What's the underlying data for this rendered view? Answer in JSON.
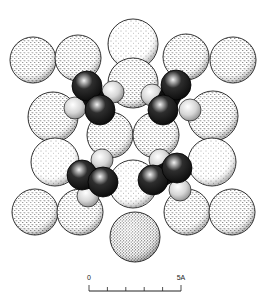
{
  "figure": {
    "width": 266,
    "height": 298,
    "colors": {
      "background": "#ffffff",
      "outline": "#1a1a1a",
      "stipple": "#2a2a2a",
      "dark_atom": "#1c1c1c",
      "dark_atom_highlight": "#e8e8e8",
      "light_atom": "#d8d8d8"
    }
  },
  "large_spheres": [
    {
      "cx": 133,
      "cy": 44,
      "r": 25,
      "density": "light"
    },
    {
      "cx": 33,
      "cy": 60,
      "r": 23,
      "density": "medium"
    },
    {
      "cx": 78,
      "cy": 58,
      "r": 23,
      "density": "medium"
    },
    {
      "cx": 186,
      "cy": 57,
      "r": 23,
      "density": "medium"
    },
    {
      "cx": 233,
      "cy": 60,
      "r": 23,
      "density": "medium"
    },
    {
      "cx": 133,
      "cy": 83,
      "r": 25,
      "density": "medium"
    },
    {
      "cx": 53,
      "cy": 117,
      "r": 25,
      "density": "medium"
    },
    {
      "cx": 213,
      "cy": 116,
      "r": 25,
      "density": "medium"
    },
    {
      "cx": 110,
      "cy": 135,
      "r": 23,
      "density": "medium"
    },
    {
      "cx": 156,
      "cy": 135,
      "r": 23,
      "density": "medium"
    },
    {
      "cx": 55,
      "cy": 162,
      "r": 24,
      "density": "light"
    },
    {
      "cx": 212,
      "cy": 162,
      "r": 24,
      "density": "light"
    },
    {
      "cx": 133,
      "cy": 184,
      "r": 24,
      "density": "light"
    },
    {
      "cx": 35,
      "cy": 212,
      "r": 23,
      "density": "medium"
    },
    {
      "cx": 80,
      "cy": 212,
      "r": 23,
      "density": "medium"
    },
    {
      "cx": 187,
      "cy": 212,
      "r": 23,
      "density": "medium"
    },
    {
      "cx": 232,
      "cy": 212,
      "r": 23,
      "density": "medium"
    },
    {
      "cx": 135,
      "cy": 237,
      "r": 25,
      "density": "dense"
    }
  ],
  "molecules": [
    {
      "name": "upper-left",
      "light_atoms": [
        {
          "cx": 75,
          "cy": 108,
          "r": 11
        },
        {
          "cx": 113,
          "cy": 92,
          "r": 11
        }
      ],
      "dark_atoms": [
        {
          "cx": 87,
          "cy": 86,
          "r": 15
        },
        {
          "cx": 100,
          "cy": 110,
          "r": 15
        }
      ]
    },
    {
      "name": "upper-right",
      "light_atoms": [
        {
          "cx": 152,
          "cy": 95,
          "r": 11
        },
        {
          "cx": 190,
          "cy": 110,
          "r": 11
        }
      ],
      "dark_atoms": [
        {
          "cx": 176,
          "cy": 85,
          "r": 15
        },
        {
          "cx": 163,
          "cy": 110,
          "r": 15
        }
      ]
    },
    {
      "name": "lower-left",
      "light_atoms": [
        {
          "cx": 102,
          "cy": 160,
          "r": 11
        },
        {
          "cx": 88,
          "cy": 196,
          "r": 11
        }
      ],
      "dark_atoms": [
        {
          "cx": 82,
          "cy": 175,
          "r": 15
        },
        {
          "cx": 103,
          "cy": 182,
          "r": 15
        }
      ]
    },
    {
      "name": "lower-right",
      "light_atoms": [
        {
          "cx": 160,
          "cy": 160,
          "r": 11
        },
        {
          "cx": 180,
          "cy": 190,
          "r": 11
        }
      ],
      "dark_atoms": [
        {
          "cx": 153,
          "cy": 180,
          "r": 15
        },
        {
          "cx": 177,
          "cy": 168,
          "r": 15
        }
      ]
    }
  ],
  "scale_bar": {
    "start_label": "0",
    "end_label": "5A",
    "x_start": 89,
    "x_end": 181,
    "y": 291,
    "tick_count": 6,
    "tick_height": 4,
    "end_tick_height": 6,
    "label_y": 280
  }
}
